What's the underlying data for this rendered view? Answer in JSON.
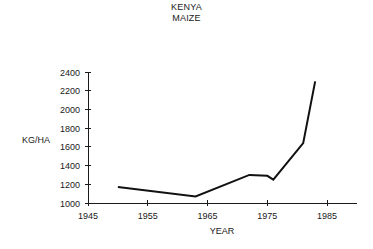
{
  "chart_data": {
    "type": "line",
    "title": "KENYA",
    "subtitle": "MAIZE",
    "xlabel": "YEAR",
    "ylabel": "KG/HA",
    "xlim": [
      1945,
      1990
    ],
    "ylim": [
      1000,
      2400
    ],
    "xticks": [
      1945,
      1955,
      1965,
      1975,
      1985
    ],
    "xtick_labels": [
      "1945",
      "1955",
      "1965",
      "1975",
      "1985"
    ],
    "yticks": [
      1000,
      1200,
      1400,
      1600,
      1800,
      2000,
      2200,
      2400
    ],
    "ytick_labels": [
      "1000",
      "1200",
      "1400",
      "1600",
      "1800",
      "2000",
      "2200",
      "2400"
    ],
    "grid": false,
    "legend": false,
    "series": [
      {
        "name": "Maize yield",
        "color": "#111111",
        "x": [
          1950,
          1963,
          1972,
          1975,
          1976,
          1981,
          1983
        ],
        "y": [
          1170,
          1070,
          1300,
          1290,
          1250,
          1640,
          2300
        ]
      }
    ]
  },
  "labels": {
    "title_line1": "KENYA",
    "title_line2": "MAIZE",
    "y_axis_label": "KG/HA",
    "x_axis_label": "YEAR"
  }
}
